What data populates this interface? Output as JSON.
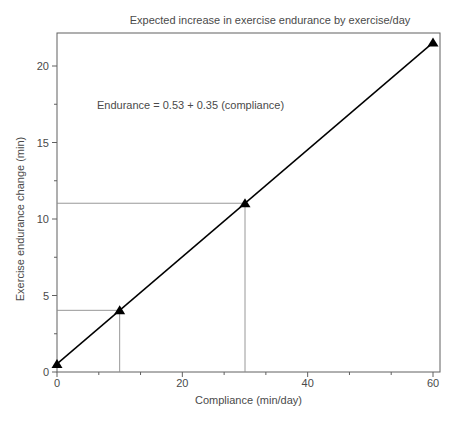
{
  "chart_data": {
    "type": "line",
    "title": "Expected increase in exercise endurance by exercise/day",
    "xlabel": "Compliance (min/day)",
    "ylabel": "Exercise endurance change (min)",
    "equation": "Endurance = 0.53 + 0.35 (compliance)",
    "regression": {
      "intercept": 0.53,
      "slope": 0.35
    },
    "points": [
      {
        "x": 0,
        "y": 0.53
      },
      {
        "x": 10,
        "y": 4.03
      },
      {
        "x": 30,
        "y": 11.03
      },
      {
        "x": 60,
        "y": 21.53
      }
    ],
    "reference_lines": [
      {
        "x": 10,
        "y": 4.03
      },
      {
        "x": 30,
        "y": 11.03
      }
    ],
    "xlim": [
      0,
      60
    ],
    "ylim": [
      0,
      20
    ],
    "x_ticks": [
      0,
      20,
      40,
      60
    ],
    "y_ticks": [
      0,
      5,
      10,
      15,
      20
    ],
    "x_minor_ticks": [
      6.67,
      13.33,
      26.67,
      33.33,
      46.67,
      53.33
    ],
    "y_minor_ticks": [
      2.5,
      7.5,
      12.5,
      17.5
    ],
    "marker": "filled-triangle-up",
    "grid": false,
    "legend": "none",
    "colors": {
      "background": "#ffffff",
      "line": "#000000",
      "marker": "#000000",
      "frame": "#606060",
      "tick": "#606060",
      "tick_label": "#4a4a4a",
      "text": "#4a4a4a",
      "reference_line": "#8c8c8c"
    }
  }
}
